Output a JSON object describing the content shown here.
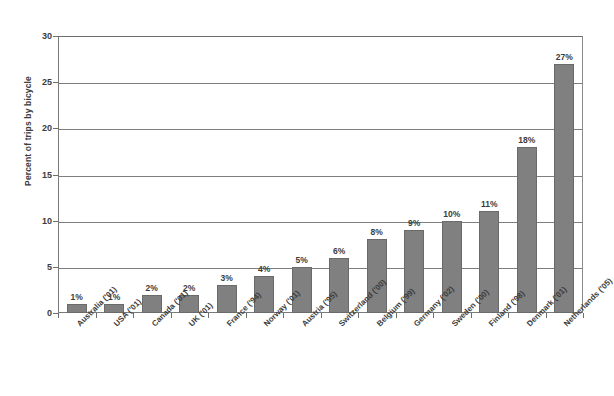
{
  "chart_data": {
    "type": "bar",
    "title": "",
    "subtitle": "",
    "xlabel": "",
    "ylabel": "Percent of trips by bicycle",
    "ylim": [
      0,
      30
    ],
    "yticks": [
      0,
      5,
      10,
      15,
      20,
      25,
      30
    ],
    "ytick_labels": [
      "0",
      "5",
      "10",
      "15",
      "20",
      "25",
      "30"
    ],
    "grid": "horizontal",
    "legend": "none",
    "bar_color": "#808080",
    "bar_border_color": "#6a6a6a",
    "axis_color": "#7a7a7a",
    "gridline_color": "#7e7e7e",
    "text_color": "#3c3c3c",
    "background_color": "#ffffff",
    "categories": [
      "Australia ('01)",
      "USA ('01)",
      "Canada ('01)",
      "UK ('01)",
      "France ('94)",
      "Norway ('01)",
      "Austria ('95)",
      "Switzerland ('00)",
      "Belgium ('99)",
      "Germany ('02)",
      "Sweden ('00)",
      "Finland ('98)",
      "Denmark ('01)",
      "Netherlands ('05)"
    ],
    "values": [
      1,
      1,
      2,
      2,
      3,
      4,
      5,
      6,
      8,
      9,
      10,
      11,
      18,
      27
    ],
    "value_labels": [
      "1%",
      "1%",
      "2%",
      "2%",
      "3%",
      "4%",
      "5%",
      "6%",
      "8%",
      "9%",
      "10%",
      "11%",
      "18%",
      "27%"
    ]
  }
}
